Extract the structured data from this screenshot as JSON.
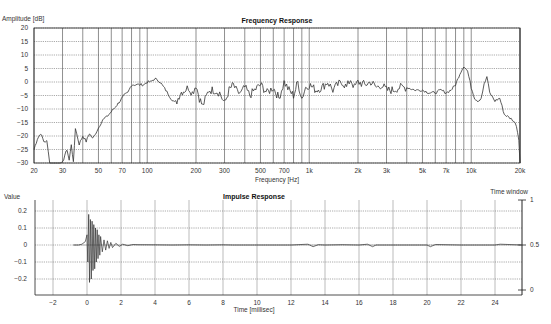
{
  "chart_data": [
    {
      "type": "line",
      "title": "Frequency Response",
      "xlabel": "Frequency [Hz]",
      "ylabel": "Amplitude [dB]",
      "xscale": "log",
      "xlim": [
        20,
        20000
      ],
      "ylim": [
        -30,
        20
      ],
      "grid": true,
      "legend": "none",
      "x_tick_labels": [
        "20",
        "30",
        "50",
        "70",
        "100",
        "200",
        "300",
        "500",
        "700",
        "1k",
        "2k",
        "3k",
        "5k",
        "7k",
        "10k",
        "20k"
      ],
      "x_tick_values": [
        20,
        30,
        50,
        70,
        100,
        200,
        300,
        500,
        700,
        1000,
        2000,
        3000,
        5000,
        7000,
        10000,
        20000
      ],
      "y_tick_labels": [
        "20",
        "15",
        "10",
        "5",
        "0",
        "-5",
        "-10",
        "-15",
        "-20",
        "-25",
        "-30"
      ],
      "y_tick_values": [
        20,
        15,
        10,
        5,
        0,
        -5,
        -10,
        -15,
        -20,
        -25,
        -30
      ],
      "series": [
        {
          "name": "Amplitude",
          "x": [
            20,
            21,
            22,
            23,
            24,
            25,
            26,
            27,
            28,
            30,
            31,
            32,
            33,
            34,
            35,
            36,
            38,
            40,
            42,
            44,
            46,
            48,
            50,
            53,
            56,
            60,
            64,
            68,
            72,
            76,
            80,
            85,
            90,
            95,
            100,
            105,
            110,
            115,
            120,
            130,
            140,
            150,
            160,
            170,
            180,
            190,
            200,
            210,
            220,
            240,
            260,
            280,
            300,
            320,
            340,
            360,
            380,
            400,
            430,
            460,
            500,
            550,
            600,
            650,
            700,
            750,
            800,
            850,
            900,
            950,
            1000,
            1100,
            1200,
            1300,
            1400,
            1500,
            1600,
            1700,
            1800,
            1900,
            2000,
            2200,
            2400,
            2600,
            2800,
            3000,
            3300,
            3600,
            4000,
            4500,
            5000,
            5500,
            6000,
            6500,
            7000,
            7500,
            8000,
            8500,
            9000,
            9500,
            10000,
            10500,
            11000,
            11500,
            12000,
            12500,
            13000,
            14000,
            15000,
            16000,
            17000,
            18000,
            19000,
            20000
          ],
          "y": [
            -25,
            -21,
            -19,
            -22,
            -22,
            -30,
            -31,
            -31,
            -31,
            -30,
            -27,
            -25,
            -29,
            -23,
            -30,
            -17,
            -23,
            -20,
            -22,
            -19,
            -21,
            -19,
            -17,
            -14,
            -13,
            -11,
            -9,
            -7,
            -5,
            -4,
            -1,
            -1,
            -1,
            -1,
            0,
            0,
            1,
            1,
            0,
            -3,
            -6,
            -8,
            -4,
            -3,
            -2,
            -4,
            -1,
            -6,
            -9,
            -3,
            -3,
            -4,
            -8,
            -3,
            -1,
            -4,
            -4,
            -2,
            -5,
            -3,
            -1,
            -4,
            -2,
            -6,
            0,
            -3,
            -5,
            0,
            -6,
            -2,
            -1,
            -3,
            -2,
            0,
            -3,
            -1,
            0,
            -2,
            1,
            -2,
            0,
            -1,
            0,
            -2,
            -1,
            -3,
            -3,
            -2,
            -2,
            -3,
            -3,
            -4,
            -4,
            -3,
            -4,
            -3,
            -1,
            3,
            6,
            4,
            -2,
            -6,
            -7,
            -6,
            -1,
            2,
            -4,
            -7,
            -6,
            -12,
            -13,
            -14,
            -16,
            -24,
            -30
          ]
        }
      ]
    },
    {
      "type": "line",
      "title": "Impulse Response",
      "xlabel": "Time [millisec]",
      "ylabel": "Value",
      "y2label": "Time window",
      "xlim": [
        -3.1,
        25.6
      ],
      "ylim": [
        -0.3,
        0.26
      ],
      "y2lim": [
        0,
        1
      ],
      "grid": true,
      "legend": "none",
      "x_tick_labels": [
        "-2",
        "0",
        "2",
        "4",
        "6",
        "8",
        "10",
        "12",
        "14",
        "16",
        "18",
        "20",
        "22",
        "24"
      ],
      "x_tick_values": [
        -2,
        0,
        2,
        4,
        6,
        8,
        10,
        12,
        14,
        16,
        18,
        20,
        22,
        24
      ],
      "y_tick_labels": [
        "0.2",
        "0.1",
        "0",
        "-0.1",
        "-0.2"
      ],
      "y_tick_values": [
        0.2,
        0.1,
        0,
        -0.1,
        -0.2
      ],
      "y2_tick_labels": [
        "1",
        "0.5",
        "0"
      ],
      "y2_tick_values": [
        1,
        0.5,
        0
      ],
      "series": [
        {
          "name": "Impulse",
          "x": [
            -0.8,
            -0.5,
            -0.3,
            -0.1,
            0.0,
            0.05,
            0.1,
            0.15,
            0.2,
            0.25,
            0.3,
            0.35,
            0.4,
            0.45,
            0.5,
            0.55,
            0.6,
            0.65,
            0.7,
            0.75,
            0.8,
            0.9,
            1.0,
            1.1,
            1.2,
            1.3,
            1.4,
            1.5,
            1.7,
            1.9,
            2.1,
            2.4,
            2.7,
            3.0,
            4,
            5,
            6,
            7,
            8,
            8.6,
            10,
            12,
            13,
            13.3,
            13.6,
            14,
            15,
            16,
            16.5,
            16.8,
            17,
            18,
            19,
            20,
            20.2,
            20.5,
            22,
            24,
            24.3,
            25.6
          ],
          "y": [
            0,
            0,
            0.005,
            0.02,
            0.06,
            -0.1,
            0.18,
            -0.22,
            0.15,
            -0.2,
            0.14,
            -0.15,
            0.12,
            -0.14,
            0.1,
            -0.1,
            0.09,
            -0.08,
            0.06,
            -0.06,
            0.05,
            -0.04,
            0.03,
            -0.03,
            0.025,
            -0.02,
            0.015,
            -0.015,
            0.01,
            -0.008,
            0.005,
            -0.004,
            0.003,
            0.002,
            0.001,
            0,
            0.001,
            0,
            0.001,
            0,
            0,
            0,
            0.005,
            -0.01,
            0.002,
            0,
            0.002,
            0,
            0.005,
            -0.01,
            0,
            0,
            0,
            0,
            -0.01,
            0.003,
            0,
            0,
            0.005,
            0
          ]
        },
        {
          "name": "Time window",
          "axis": "y2",
          "x": [
            -0.8,
            25.6
          ],
          "y": [
            0.5,
            0.5
          ]
        }
      ]
    }
  ],
  "header_fragments": "…"
}
